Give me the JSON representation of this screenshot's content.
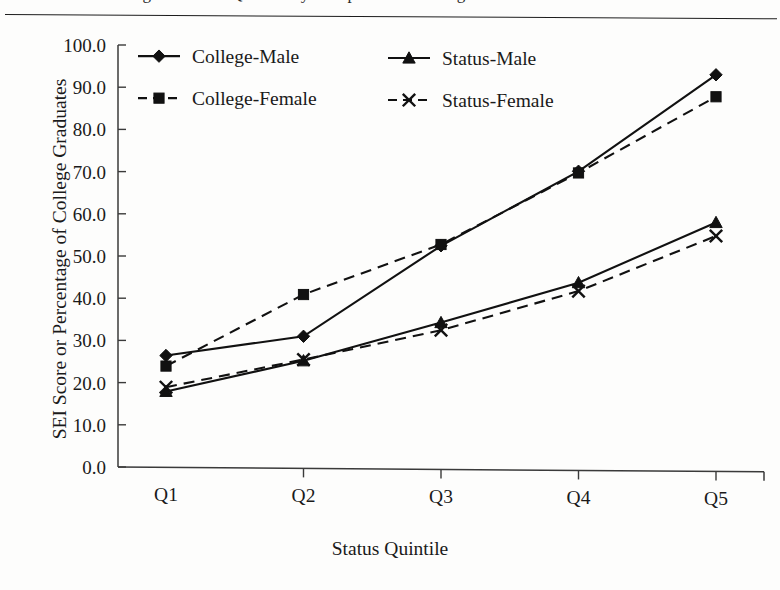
{
  "page": {
    "cut_title": "Figure: Status Quintile by Completed Schooling",
    "has_top_rule": true
  },
  "chart_data": {
    "type": "line",
    "title": "",
    "xlabel": "Status Quintile",
    "ylabel": "SEI Score or Percentage of College Graduates",
    "categories": [
      "Q1",
      "Q2",
      "Q3",
      "Q4",
      "Q5"
    ],
    "ylim": [
      0,
      100
    ],
    "yticks": [
      "0.0",
      "10.0",
      "20.0",
      "30.0",
      "40.0",
      "50.0",
      "60.0",
      "70.0",
      "80.0",
      "90.0",
      "100.0"
    ],
    "ytick_step": 10,
    "grid": false,
    "legend_position": "top-left-inside",
    "series": [
      {
        "name": "College-Male",
        "marker": "diamond",
        "line": "solid",
        "color": "#111111",
        "values": [
          26.5,
          31.3,
          53.0,
          70.9,
          94.0
        ]
      },
      {
        "name": "College-Female",
        "marker": "square",
        "line": "dashed",
        "color": "#111111",
        "values": [
          24.0,
          41.2,
          53.3,
          70.5,
          88.8
        ]
      },
      {
        "name": "Status-Male",
        "marker": "triangle",
        "line": "solid",
        "color": "#111111",
        "values": [
          18.0,
          25.5,
          34.8,
          44.5,
          59.0
        ]
      },
      {
        "name": "Status-Female",
        "marker": "cross",
        "line": "dashed",
        "color": "#111111",
        "values": [
          19.0,
          25.8,
          33.0,
          42.5,
          55.8
        ]
      }
    ]
  }
}
